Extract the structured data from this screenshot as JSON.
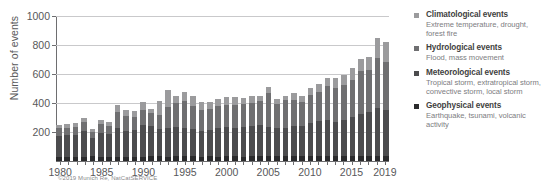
{
  "chart_data": {
    "type": "bar",
    "subtype": "stacked",
    "title": "",
    "xlabel": "",
    "ylabel": "Number of events",
    "ylim": [
      0,
      1000
    ],
    "yticks": [
      0,
      200,
      400,
      600,
      800,
      1000
    ],
    "ytick_labels": [
      "",
      "200",
      "400",
      "600",
      "800",
      "1000"
    ],
    "xticks": [
      "1980",
      "1985",
      "1990",
      "1995",
      "2000",
      "2005",
      "2010",
      "2015",
      "2019"
    ],
    "grid": "horizontal",
    "legend_position": "right",
    "categories": [
      "1980",
      "1981",
      "1982",
      "1983",
      "1984",
      "1985",
      "1986",
      "1987",
      "1988",
      "1989",
      "1990",
      "1991",
      "1992",
      "1993",
      "1994",
      "1995",
      "1996",
      "1997",
      "1998",
      "1999",
      "2000",
      "2001",
      "2002",
      "2003",
      "2004",
      "2005",
      "2006",
      "2007",
      "2008",
      "2009",
      "2010",
      "2011",
      "2012",
      "2013",
      "2014",
      "2015",
      "2016",
      "2017",
      "2018",
      "2019"
    ],
    "series": [
      {
        "name": "Geophysical events",
        "color": "#2b2b2d",
        "values": [
          30,
          28,
          30,
          26,
          38,
          26,
          30,
          30,
          30,
          28,
          30,
          34,
          32,
          30,
          36,
          34,
          32,
          30,
          32,
          30,
          34,
          36,
          30,
          34,
          36,
          36,
          34,
          36,
          34,
          36,
          38,
          38,
          36,
          36,
          36,
          36,
          34,
          38,
          38,
          34
        ]
      },
      {
        "name": "Meteorological events",
        "color": "#4c4c4e",
        "values": [
          145,
          150,
          150,
          180,
          120,
          165,
          155,
          200,
          180,
          185,
          215,
          205,
          190,
          200,
          200,
          195,
          190,
          175,
          185,
          200,
          200,
          195,
          205,
          210,
          215,
          200,
          195,
          195,
          210,
          205,
          225,
          240,
          250,
          235,
          250,
          270,
          290,
          300,
          330,
          320
        ]
      },
      {
        "name": "Hydrological events",
        "color": "#6f6f71",
        "values": [
          50,
          50,
          55,
          60,
          45,
          65,
          60,
          110,
          100,
          90,
          110,
          90,
          95,
          140,
          165,
          185,
          160,
          150,
          145,
          150,
          155,
          155,
          155,
          155,
          160,
          235,
          165,
          190,
          180,
          165,
          195,
          200,
          230,
          230,
          235,
          250,
          300,
          290,
          340,
          330
        ]
      },
      {
        "name": "Climatological events",
        "color": "#9b9b9d",
        "values": [
          25,
          30,
          30,
          30,
          20,
          25,
          25,
          45,
          45,
          45,
          50,
          30,
          95,
          120,
          50,
          65,
          65,
          55,
          45,
          45,
          50,
          55,
          45,
          50,
          40,
          40,
          35,
          30,
          45,
          40,
          45,
          55,
          60,
          75,
          75,
          85,
          80,
          90,
          140,
          140
        ]
      }
    ]
  },
  "credit": "©2019 Munich Re, NatCatSERVICE",
  "legend": {
    "entries": [
      {
        "title": "Climatological events",
        "desc": "Extreme temperature, drought, forest fire",
        "color": "#9b9b9d"
      },
      {
        "title": "Hydrological events",
        "desc": "Flood, mass movement",
        "color": "#6f6f71"
      },
      {
        "title": "Meteorological events",
        "desc": "Tropical storm, extratropical storm, convective storm, local storm",
        "color": "#4c4c4e"
      },
      {
        "title": "Geophysical events",
        "desc": "Earthquake, tsunami, volcanic activity",
        "color": "#2b2b2d"
      }
    ]
  }
}
